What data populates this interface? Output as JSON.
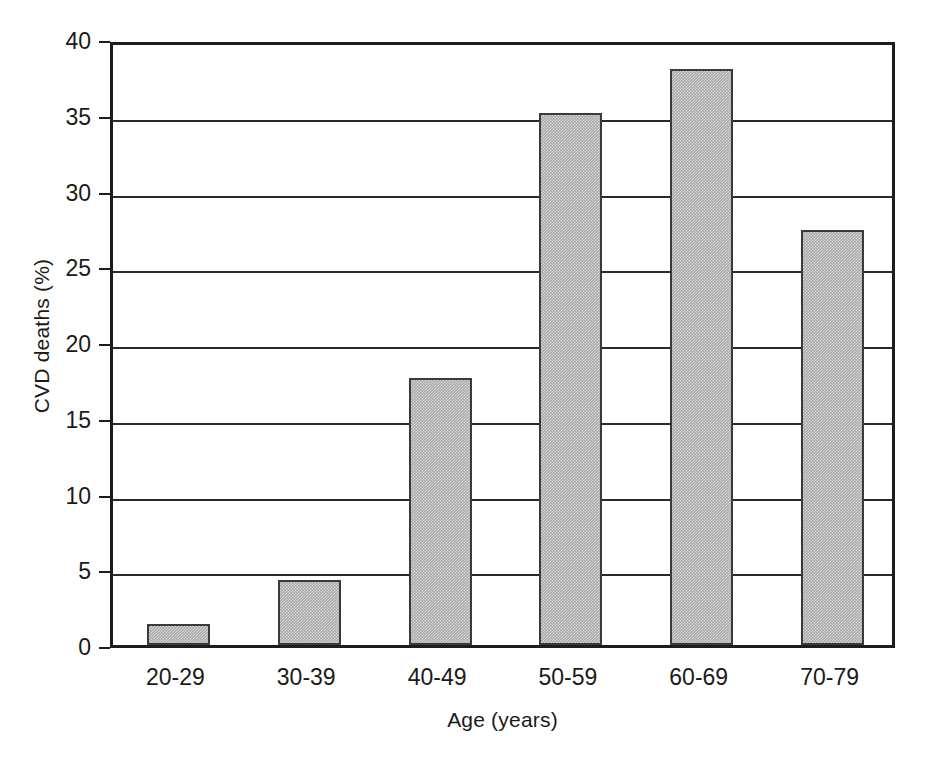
{
  "chart_data": {
    "type": "bar",
    "title": "",
    "subtitle": "",
    "categories": [
      "20-29",
      "30-39",
      "40-49",
      "50-59",
      "60-69",
      "70-79"
    ],
    "values": [
      1.4,
      4.3,
      17.6,
      35.1,
      38.0,
      27.4
    ],
    "xlabel": "Age (years)",
    "ylabel": "CVD deaths (%)",
    "ylim": [
      0,
      40
    ],
    "yticks": [
      0,
      5,
      10,
      15,
      20,
      25,
      30,
      35,
      40
    ],
    "ytick_labels": [
      "0",
      "5",
      "10",
      "15",
      "20",
      "25",
      "30",
      "35",
      "40"
    ],
    "grid": true,
    "grid_axis": "y",
    "legend": false,
    "legend_position": "none",
    "annotations": [],
    "colors": {
      "bar_fill": "#a8a8a8",
      "bar_border": "#3a3a3a",
      "axis": "#1d1d1d",
      "grid": "#2a2a2a",
      "text": "#1a1a1a",
      "background": "#ffffff"
    }
  }
}
